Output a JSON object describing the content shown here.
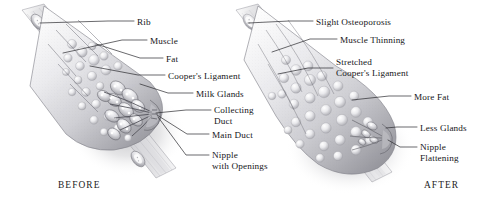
{
  "figure": {
    "background_color": "#ffffff",
    "ink_color": "#16161a",
    "leader_color": "#2a2a2e"
  },
  "panels": [
    {
      "id": "before",
      "caption": "BEFORE",
      "caption_x": 58,
      "caption_y": 180,
      "labels": [
        {
          "id": "rib",
          "lines": [
            "Rib"
          ],
          "x": 137,
          "y": 17,
          "leader": [
            [
              134,
              21
            ],
            [
              108,
              21
            ],
            [
              40,
              23
            ]
          ]
        },
        {
          "id": "muscle",
          "lines": [
            "Muscle"
          ],
          "x": 150,
          "y": 36,
          "leader": [
            [
              147,
              40
            ],
            [
              122,
              40
            ],
            [
              63,
              53
            ]
          ]
        },
        {
          "id": "fat",
          "lines": [
            "Fat"
          ],
          "x": 166,
          "y": 54,
          "leader": [
            [
              163,
              58
            ],
            [
              140,
              58
            ],
            [
              96,
              44
            ]
          ]
        },
        {
          "id": "coopers-ligament",
          "lines": [
            "Cooper's Ligament"
          ],
          "x": 168,
          "y": 71,
          "leader": [
            [
              165,
              75
            ],
            [
              138,
              75
            ],
            [
              90,
              66
            ]
          ]
        },
        {
          "id": "milk-glands",
          "lines": [
            "Milk Glands"
          ],
          "x": 196,
          "y": 89,
          "leader": [
            [
              193,
              93
            ],
            [
              168,
              93
            ],
            [
              140,
              84
            ]
          ]
        },
        {
          "id": "collecting-duct",
          "lines": [
            "Collecting",
            "Duct"
          ],
          "x": 214,
          "y": 105,
          "leader": [
            [
              211,
              110
            ],
            [
              186,
              110
            ],
            [
              156,
              113
            ]
          ]
        },
        {
          "id": "main-duct",
          "lines": [
            "Main Duct"
          ],
          "x": 212,
          "y": 130,
          "leader": [
            [
              209,
              134
            ],
            [
              187,
              134
            ],
            [
              157,
              115
            ]
          ]
        },
        {
          "id": "nipple-openings",
          "lines": [
            "Nipple",
            "with Openings"
          ],
          "x": 212,
          "y": 150,
          "leader": [
            [
              209,
              155
            ],
            [
              186,
              155
            ],
            [
              158,
              117
            ]
          ]
        }
      ]
    },
    {
      "id": "after",
      "caption": "AFTER",
      "caption_x": 424,
      "caption_y": 180,
      "labels": [
        {
          "id": "slight-osteoporosis",
          "lines": [
            "Slight Osteoporosis"
          ],
          "x": 316,
          "y": 17,
          "leader": [
            [
              313,
              21
            ],
            [
              289,
              21
            ],
            [
              248,
              23
            ]
          ]
        },
        {
          "id": "muscle-thinning",
          "lines": [
            "Muscle Thinning"
          ],
          "x": 340,
          "y": 35,
          "leader": [
            [
              337,
              39
            ],
            [
              310,
              39
            ],
            [
              272,
              52
            ]
          ]
        },
        {
          "id": "stretched-coopers",
          "lines": [
            "Stretched",
            "Cooper's Ligament"
          ],
          "x": 336,
          "y": 57,
          "leader": [
            [
              333,
              68
            ],
            [
              308,
              68
            ],
            [
              278,
              74
            ]
          ]
        },
        {
          "id": "more-fat",
          "lines": [
            "More Fat"
          ],
          "x": 414,
          "y": 92,
          "leader": [
            [
              411,
              96
            ],
            [
              389,
              96
            ],
            [
              352,
              100
            ]
          ]
        },
        {
          "id": "less-glands",
          "lines": [
            "Less Glands"
          ],
          "x": 420,
          "y": 123,
          "leader": [
            [
              417,
              127
            ],
            [
              397,
              127
            ],
            [
              386,
              128
            ]
          ]
        },
        {
          "id": "nipple-flattening",
          "lines": [
            "Nipple",
            "Flattening"
          ],
          "x": 420,
          "y": 142,
          "leader": [
            [
              417,
              147
            ],
            [
              400,
              147
            ],
            [
              388,
              140
            ]
          ]
        }
      ]
    }
  ]
}
